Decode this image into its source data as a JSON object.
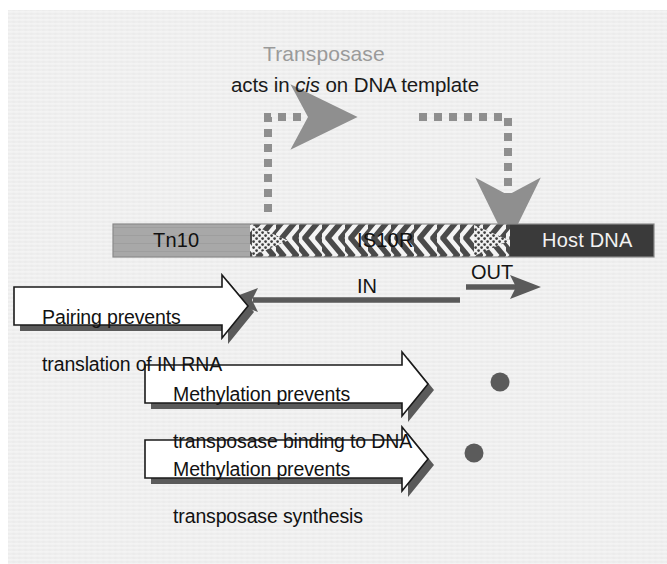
{
  "figure": {
    "background_color": "#ececec",
    "page_color": "#ffffff"
  },
  "heading": {
    "transposase_label": "Transposase",
    "transposase_color": "#9a9a9a",
    "cis_line_prefix": "acts in ",
    "cis_word": "cis",
    "cis_line_suffix": " on DNA template"
  },
  "transposase_paths": {
    "color": "#8f8f8f",
    "left_path_name": "acts-in-cis-left-dashed-arrow",
    "right_path_name": "acts-in-cis-right-dashed-arrow"
  },
  "dna_bar": {
    "segments": [
      {
        "name": "tn10",
        "label": "Tn10",
        "fill": "#a8a8a8",
        "text_color": "#111111"
      },
      {
        "name": "is10r",
        "label": "IS10R",
        "fill": "#ffffff",
        "text_color": "#111111"
      },
      {
        "name": "host-dna",
        "label": "Host DNA",
        "fill": "#3a3a3a",
        "text_color": "#f2f2f2"
      }
    ],
    "chevron_color": "#4a4a4a",
    "terminal_repeat_name": "inverted-terminal-repeat"
  },
  "transcripts": {
    "in": {
      "label": "IN",
      "direction": "left",
      "color": "#555555"
    },
    "out": {
      "label": "OUT",
      "direction": "right",
      "color": "#555555"
    }
  },
  "callouts": [
    {
      "name": "pairing-prevents-translation",
      "line1": "Pairing prevents",
      "line2": "translation of IN RNA",
      "fill": "#ffffff",
      "outline": "#1a1a1a",
      "shadow": "#5a5a5a",
      "has_methyl_dot": false
    },
    {
      "name": "methylation-prevents-binding",
      "line1": "Methylation prevents",
      "line2": "transposase binding to DNA",
      "fill": "#ffffff",
      "outline": "#1a1a1a",
      "shadow": "#5a5a5a",
      "has_methyl_dot": true
    },
    {
      "name": "methylation-prevents-synthesis",
      "line1": "Methylation prevents",
      "line2": "transposase synthesis",
      "fill": "#ffffff",
      "outline": "#1a1a1a",
      "shadow": "#5a5a5a",
      "has_methyl_dot": true
    }
  ],
  "methylation_dots": {
    "color": "#5b5b5b",
    "count": 2,
    "name": "methylation-site-dot"
  }
}
